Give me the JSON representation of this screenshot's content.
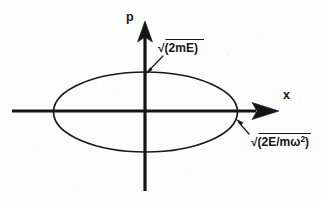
{
  "figure": {
    "type": "phase-space-diagram",
    "background_color": "#fdfdfd",
    "ink_color": "#141414",
    "axes": {
      "horizontal": {
        "label": "x",
        "name": "x-axis",
        "y_position": 111,
        "x_start": 12,
        "x_end": 278
      },
      "vertical": {
        "label": "p",
        "name": "p-axis",
        "x_position": 145,
        "y_start": 22,
        "y_end": 191
      }
    },
    "curve": {
      "name": "energy-ellipse",
      "shape": "ellipse",
      "center_x": 145.5,
      "center_y": 112,
      "semi_axis_x": 92,
      "semi_axis_y": 40
    },
    "annotations": [
      {
        "id": "p-intercept",
        "text_before": "√(2mE)",
        "superscript": "",
        "text_after": "",
        "target": "ellipse top vertex on p axis",
        "text_x": 158,
        "text_y": 52,
        "pointer_from_x": 163,
        "pointer_from_y": 56,
        "pointer_to_x": 146,
        "pointer_to_y": 73
      },
      {
        "id": "x-intercept",
        "text_before": "√(2E/mω",
        "superscript": "2",
        "text_after": ")",
        "target": "ellipse right vertex on x axis",
        "text_x": 251,
        "text_y": 146,
        "pointer_from_x": 249,
        "pointer_from_y": 134,
        "pointer_to_x": 236,
        "pointer_to_y": 119
      }
    ]
  }
}
